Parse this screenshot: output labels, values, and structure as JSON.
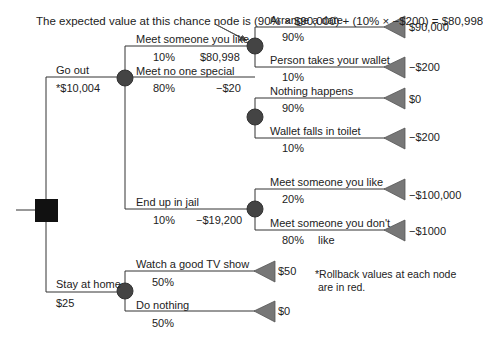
{
  "annotation": "The expected value at this chance node is (90% × $90,000) + (10% × −$200) = $80,998",
  "footnote_line1": "*Rollback values at each node",
  "footnote_line2": "are in red.",
  "decision": {
    "go_out": {
      "label": "Go out",
      "value": "*$10,004"
    },
    "stay_home": {
      "label": "Stay at home",
      "value": "$25"
    }
  },
  "go_out_branches": [
    {
      "label": "Meet someone you like",
      "prob": "10%",
      "value": "$80,998"
    },
    {
      "label": "Meet no one special",
      "prob": "80%",
      "value": "−$20"
    },
    {
      "label": "End up in jail",
      "prob": "10%",
      "value": "−$19,200"
    }
  ],
  "outcomes": {
    "like": [
      {
        "label": "Arrange a date",
        "prob": "90%",
        "payoff": "$90,000"
      },
      {
        "label": "Person takes your wallet",
        "prob": "10%",
        "payoff": "−$200"
      }
    ],
    "no_one": [
      {
        "label": "Nothing happens",
        "prob": "90%",
        "payoff": "$0"
      },
      {
        "label": "Wallet falls in toilet",
        "prob": "10%",
        "payoff": "−$200"
      }
    ],
    "jail": [
      {
        "label": "Meet someone you like",
        "prob": "20%",
        "payoff": "−$100,000"
      },
      {
        "label": "Meet someone you don't",
        "label_cont": "like",
        "prob": "80%",
        "payoff": "−$1000"
      }
    ],
    "home": [
      {
        "label": "Watch a good TV show",
        "prob": "50%",
        "payoff": "$50"
      },
      {
        "label": "Do nothing",
        "prob": "50%",
        "payoff": "$0"
      }
    ]
  },
  "colors": {
    "line": "#333333",
    "node": "#444444",
    "terminal": "#777777"
  }
}
